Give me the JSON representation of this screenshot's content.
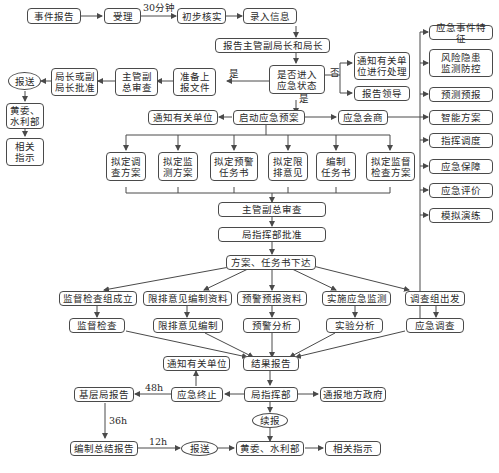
{
  "nodes": {
    "event_report": "事件报告",
    "accept": "受理",
    "preliminary_check": "初步核实",
    "record_info": "录入信息",
    "report_chief": "报告主管副局长和局长",
    "enter_emergency": "是否进入\n应急状态",
    "notify_handle": "通知有关单\n位进行处理",
    "report_leader": "报告领导",
    "prepare_docs": "准备上\n报文件",
    "deputy_review_1": "主管副\n总审查",
    "director_approve": "局长或副\n局长批准",
    "submit_1": "报送",
    "yellow_water_1": "黄委、\n水利部",
    "instructions_1": "相关\n指示",
    "notify_units_1": "通知有关单位",
    "launch_plan": "启动应急预案",
    "emergency_consult": "应急会商",
    "side_items": [
      "应急事件特征",
      "风险隐患\n监测防控",
      "预测预报",
      "智能方案",
      "指挥调度",
      "应急保障",
      "应急评价",
      "模拟演练"
    ],
    "plans": [
      "拟定调\n查方案",
      "拟定监\n测方案",
      "拟定预警\n任务书",
      "拟定限\n排意见",
      "编制\n任务书",
      "拟定监督\n检查方案"
    ],
    "deputy_review_2": "主管副总审查",
    "hq_approve": "局指挥部批准",
    "issue_tasks": "方案、任务书下达",
    "tasks": [
      "监督检查组成立",
      "限排意见编制资料",
      "预警预报资料",
      "实施应急监测",
      "调查组出发"
    ],
    "actions": [
      "监督检查",
      "限排意见编制",
      "预警分析",
      "实验分析",
      "应急调查"
    ],
    "result_report": "结果报告",
    "notify_units_2": "通知有关单位",
    "emergency_end": "应急终止",
    "hq": "局指挥部",
    "notify_gov": "通报地方政府",
    "base_report": "基层局报告",
    "continue_report": "续报",
    "summary_report": "编制总结报告",
    "submit_2": "报送",
    "yellow_water_2": "黄委、水利部",
    "instructions_2": "相关指示"
  },
  "labels": {
    "thirty_min": "30分钟",
    "yes_left": "是",
    "no": "否",
    "yes_down": "是",
    "h48": "48h",
    "h36": "36h",
    "h12": "12h"
  },
  "colors": {
    "line": "#4a4a4a",
    "text": "#2a2a2a",
    "background": "#ffffff"
  }
}
